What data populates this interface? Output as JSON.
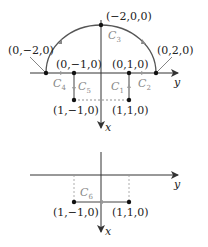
{
  "top_diagram": {
    "axes": {
      "horizontal": "y",
      "vertical": "x"
    },
    "points": [
      {
        "id": "p_top",
        "label": "(−2,0,0)"
      },
      {
        "id": "p_left",
        "label": "(0,−2,0)"
      },
      {
        "id": "p_right",
        "label": "(0,2,0)"
      },
      {
        "id": "p_m1",
        "label": "(0,−1,0)"
      },
      {
        "id": "p_p1",
        "label": "(0,1,0)"
      },
      {
        "id": "p_b_m1",
        "label": "(1,−1,0)"
      },
      {
        "id": "p_b_p1",
        "label": "(1,1,0)"
      }
    ],
    "curves": [
      {
        "name": "C",
        "sub": "1"
      },
      {
        "name": "C",
        "sub": "2"
      },
      {
        "name": "C",
        "sub": "3"
      },
      {
        "name": "C",
        "sub": "4"
      },
      {
        "name": "C",
        "sub": "5"
      }
    ]
  },
  "bottom_diagram": {
    "axes": {
      "horizontal": "y",
      "vertical": "x"
    },
    "points": [
      {
        "id": "q_m1",
        "label": "(1,−1,0)"
      },
      {
        "id": "q_p1",
        "label": "(1,1,0)"
      }
    ],
    "curves": [
      {
        "name": "C",
        "sub": "6"
      }
    ]
  },
  "colors": {
    "line": "#444444",
    "curve_label": "#888888",
    "arrow_gray": "#999999"
  }
}
